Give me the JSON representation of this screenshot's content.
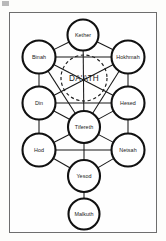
{
  "diagram": {
    "type": "kabbalistic-sephiroth-diagram",
    "frame": {
      "stroke_color": "#6e6e6e"
    },
    "background_color": "#fdfdfb",
    "node_stroke_color": "#111111",
    "node_fill_color": "#ffffff",
    "path_color": "#171717",
    "nodes": [
      {
        "id": "kether",
        "label": "Kether",
        "cx": 83,
        "cy": 35,
        "r": 15.5,
        "pillar": "middle"
      },
      {
        "id": "binah",
        "label": "Binah",
        "cx": 39,
        "cy": 57,
        "r": 16.5,
        "pillar": "left"
      },
      {
        "id": "hokhmah",
        "label": "Hokhmah",
        "cx": 128,
        "cy": 57,
        "r": 16.5,
        "pillar": "right"
      },
      {
        "id": "din",
        "label": "Din",
        "cx": 39,
        "cy": 103,
        "r": 16.5,
        "pillar": "left"
      },
      {
        "id": "hesed",
        "label": "Hesed",
        "cx": 128,
        "cy": 103,
        "r": 16.5,
        "pillar": "right"
      },
      {
        "id": "tifereth",
        "label": "Tifereth",
        "cx": 84,
        "cy": 127,
        "r": 16.0,
        "pillar": "middle"
      },
      {
        "id": "hod",
        "label": "Hod",
        "cx": 39,
        "cy": 150,
        "r": 16.5,
        "pillar": "left"
      },
      {
        "id": "netsah",
        "label": "Netsah",
        "cx": 128,
        "cy": 150,
        "r": 16.5,
        "pillar": "right"
      },
      {
        "id": "yesod",
        "label": "Yesod",
        "cx": 84,
        "cy": 176,
        "r": 16.0,
        "pillar": "middle"
      },
      {
        "id": "malkuth",
        "label": "Malkuth",
        "cx": 84,
        "cy": 214,
        "r": 15.5,
        "pillar": "middle"
      }
    ],
    "hidden_node": {
      "id": "daath",
      "label": "DA'ATH",
      "cx": 84,
      "cy": 78,
      "r": 23,
      "style": "dashed"
    },
    "paths": [
      {
        "from": "kether",
        "to": "binah"
      },
      {
        "from": "kether",
        "to": "hokhmah"
      },
      {
        "from": "kether",
        "to": "tifereth"
      },
      {
        "from": "binah",
        "to": "hokhmah"
      },
      {
        "from": "binah",
        "to": "din"
      },
      {
        "from": "binah",
        "to": "tifereth"
      },
      {
        "from": "hokhmah",
        "to": "hesed"
      },
      {
        "from": "hokhmah",
        "to": "tifereth"
      },
      {
        "from": "din",
        "to": "hesed"
      },
      {
        "from": "din",
        "to": "hod"
      },
      {
        "from": "din",
        "to": "tifereth"
      },
      {
        "from": "hesed",
        "to": "netsah"
      },
      {
        "from": "hesed",
        "to": "tifereth"
      },
      {
        "from": "tifereth",
        "to": "hod"
      },
      {
        "from": "tifereth",
        "to": "netsah"
      },
      {
        "from": "tifereth",
        "to": "yesod"
      },
      {
        "from": "hod",
        "to": "netsah"
      },
      {
        "from": "hod",
        "to": "yesod"
      },
      {
        "from": "netsah",
        "to": "yesod"
      },
      {
        "from": "yesod",
        "to": "malkuth"
      },
      {
        "from": "binah",
        "to": "hesed"
      },
      {
        "from": "hokhmah",
        "to": "din"
      }
    ]
  }
}
